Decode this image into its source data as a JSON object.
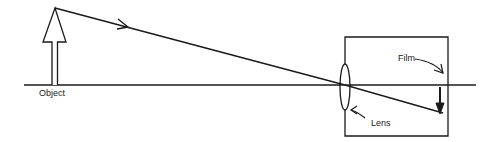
{
  "diagram": {
    "labels": {
      "object": "Object",
      "lens": "Lens",
      "film": "Film"
    },
    "colors": {
      "stroke": "#1a1a1a",
      "background": "#ffffff"
    },
    "elements": {
      "optical_axis": {
        "x1": 24,
        "y1": 85,
        "x2": 476,
        "y2": 85
      },
      "object_arrow": {
        "tip": [
          55,
          8
        ],
        "head_base_y": 42,
        "head_half_width": 11,
        "shaft_half_width": 3,
        "base_y": 85
      },
      "light_ray": {
        "points": [
          [
            55,
            8
          ],
          [
            345,
            85
          ],
          [
            443,
            113
          ]
        ],
        "direction_arrow_at": [
          125,
          26
        ]
      },
      "camera_box": {
        "x": 345,
        "y": 37,
        "width": 103,
        "height": 99
      },
      "lens": {
        "cx": 345,
        "cy": 87,
        "rx": 5,
        "ry": 23
      },
      "image_arrow": {
        "x": 440,
        "y_start": 87,
        "y_end": 113
      }
    }
  }
}
